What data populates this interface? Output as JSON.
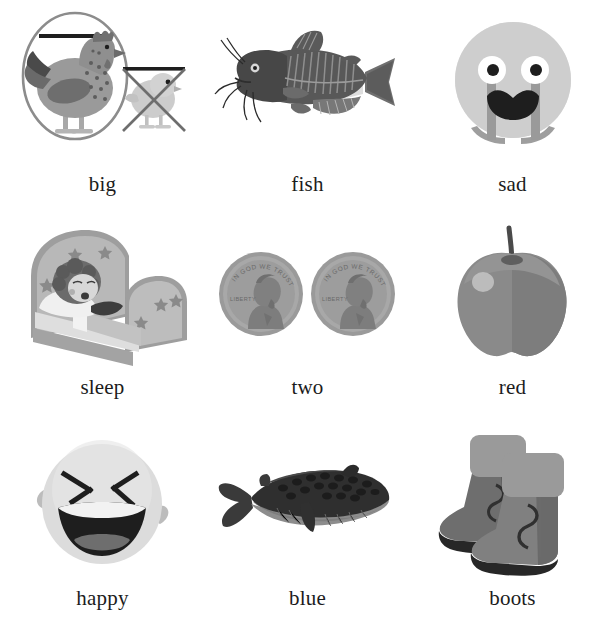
{
  "page": {
    "background_color": "#ffffff",
    "columns": 3,
    "rows": 3
  },
  "palette": {
    "text": "#1c1c1c",
    "outline": "#8a8a8a",
    "dark": "#3a3a3a",
    "mid_dark": "#5e5e5e",
    "mid": "#7d7d7d",
    "light_mid": "#a0a0a0",
    "light": "#c4c4c4",
    "pale": "#dcdcdc",
    "near_white": "#eeeeee",
    "black": "#1a1a1a"
  },
  "cards": [
    {
      "id": "big",
      "label": "big",
      "icon": "chicken-and-chick-comparison-icon",
      "description": "Large hen circled with a measuring bar, small chick crossed out"
    },
    {
      "id": "fish",
      "label": "fish",
      "icon": "catfish-icon",
      "description": "Catfish with barbels facing left"
    },
    {
      "id": "sad",
      "label": "sad",
      "icon": "crying-face-icon",
      "description": "Round face with wide eyes, open frowning mouth and tears"
    },
    {
      "id": "sleep",
      "label": "sleep",
      "icon": "child-sleeping-in-bed-icon",
      "description": "Child asleep in a bed with star-decorated headboard"
    },
    {
      "id": "two",
      "label": "two",
      "icon": "two-pennies-icon",
      "description": "Two penny coins showing Lincoln profile",
      "coin_text": {
        "motto": "IN GOD WE TRUST",
        "liberty": "LIBERTY"
      }
    },
    {
      "id": "red",
      "label": "red",
      "icon": "apple-icon",
      "description": "Apple with stem and highlight"
    },
    {
      "id": "happy",
      "label": "happy",
      "icon": "laughing-face-icon",
      "description": "Round face laughing with closed X eyes and open mouth"
    },
    {
      "id": "blue",
      "label": "blue",
      "icon": "whale-icon",
      "description": "Blue whale with fluke on the left"
    },
    {
      "id": "boots",
      "label": "boots",
      "icon": "pair-of-boots-icon",
      "description": "Pair of cuffed boots with dark soles"
    }
  ]
}
